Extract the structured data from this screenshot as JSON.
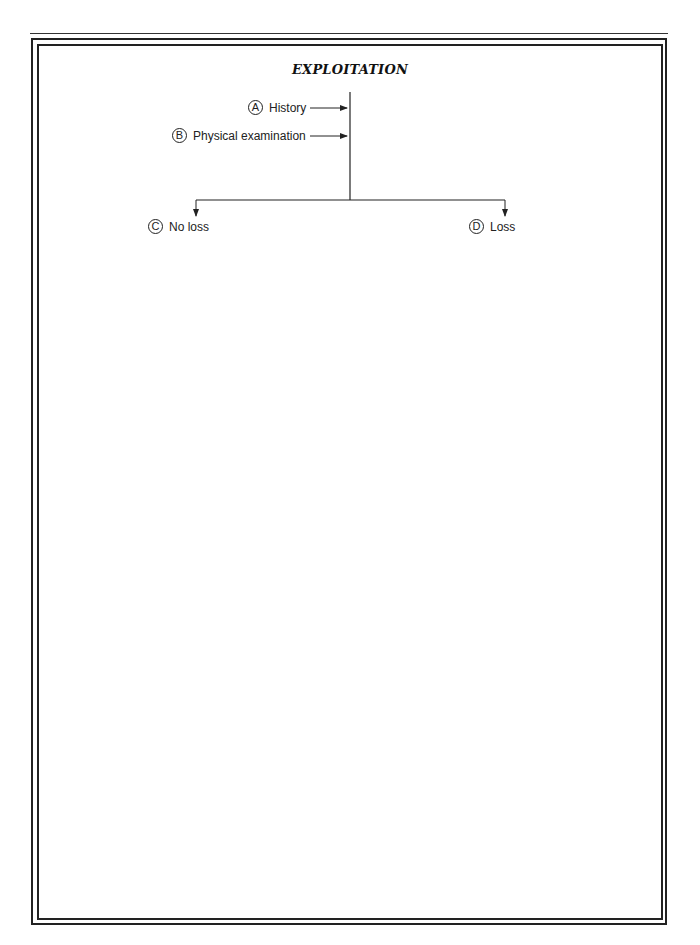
{
  "title": "EXPLOITATION",
  "inputs": [
    {
      "letter": "A",
      "label": "History"
    },
    {
      "letter": "B",
      "label": "Physical examination"
    }
  ],
  "outcomes": [
    {
      "letter": "C",
      "label": "No loss"
    },
    {
      "letter": "D",
      "label": "Loss"
    }
  ]
}
